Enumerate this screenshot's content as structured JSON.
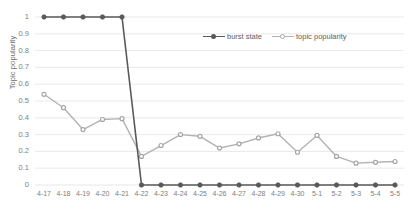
{
  "chart_data": {
    "type": "line",
    "title": "",
    "xlabel": "",
    "ylabel": "Topic popularity",
    "ylim": [
      0,
      1
    ],
    "ytick_step": 0.1,
    "grid": true,
    "legend_position": "top-center",
    "categories": [
      "4-17",
      "4-18",
      "4-19",
      "4-20",
      "4-21",
      "4-22",
      "4-23",
      "4-24",
      "4-25",
      "4-26",
      "4-27",
      "4-28",
      "4-29",
      "4-30",
      "5-1",
      "5-2",
      "5-3",
      "5-4",
      "5-5"
    ],
    "ytick_labels": [
      "1",
      "0.9",
      "0.8",
      "0.7",
      "0.6",
      "0.5",
      "0.4",
      "0.3",
      "0.2",
      "0.1",
      "0"
    ],
    "ytick_values": [
      1,
      0.9,
      0.8,
      0.7,
      0.6,
      0.5,
      0.4,
      0.3,
      0.2,
      0.1,
      0
    ],
    "series": [
      {
        "name": "burst state",
        "color": "#595959",
        "marker_color": "#595959",
        "values": [
          1,
          1,
          1,
          1,
          1,
          0,
          0,
          0,
          0,
          0,
          0,
          0,
          0,
          0,
          0,
          0,
          0,
          0,
          0
        ]
      },
      {
        "name": "topic popularity",
        "color": "#b3b3b3",
        "marker_color": "#a6a6a6",
        "values": [
          0.54,
          0.46,
          0.33,
          0.39,
          0.395,
          0.17,
          0.235,
          0.3,
          0.29,
          0.22,
          0.245,
          0.28,
          0.305,
          0.195,
          0.295,
          0.17,
          0.13,
          0.135,
          0.14
        ]
      }
    ]
  },
  "legend": {
    "entries": [
      {
        "label": "burst state"
      },
      {
        "label": "topic popularity"
      }
    ]
  },
  "axes": {
    "y_title": "Topic popularity"
  },
  "colors": {
    "burst_state": "#595959",
    "topic_popularity": "#b3b3b3",
    "gridline": "#e3e3e3",
    "tick_text": "#808080"
  }
}
